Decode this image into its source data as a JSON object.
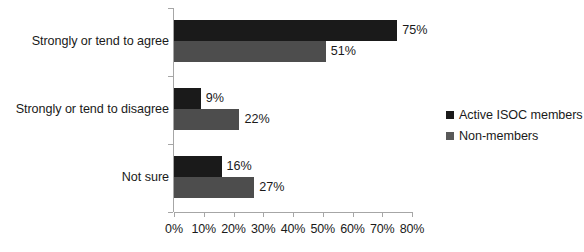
{
  "chart_data": {
    "type": "bar",
    "orientation": "horizontal",
    "title": "",
    "subtitle": "",
    "xlabel": "",
    "ylabel": "",
    "categories": [
      "Strongly or tend to agree",
      "Strongly or tend to disagree",
      "Not sure"
    ],
    "series": [
      {
        "name": "Active ISOC members",
        "color": "#1a1a1a",
        "values": [
          75,
          9,
          16
        ],
        "labels": [
          "75%",
          "9%",
          "16%"
        ]
      },
      {
        "name": "Non-members",
        "color": "#4d4d4d",
        "values": [
          51,
          22,
          27
        ],
        "labels": [
          "51%",
          "22%",
          "27%"
        ]
      }
    ],
    "xlim": [
      0,
      80
    ],
    "xtick_values": [
      0,
      10,
      20,
      30,
      40,
      50,
      60,
      70,
      80
    ],
    "xtick_labels": [
      "0%",
      "10%",
      "20%",
      "30%",
      "40%",
      "50%",
      "60%",
      "70%",
      "80%"
    ],
    "grid": false,
    "legend_position": "right",
    "data_labels_shown": true
  },
  "legend": {
    "items": [
      {
        "label": "Active ISOC members",
        "color": "#1a1a1a"
      },
      {
        "label": "Non-members",
        "color": "#595959"
      }
    ]
  },
  "colors": {
    "series_0": "#1a1a1a",
    "series_1": "#4d4d4d",
    "axis": "#a6a6a6",
    "text": "#1a1a1a",
    "background": "#ffffff"
  }
}
